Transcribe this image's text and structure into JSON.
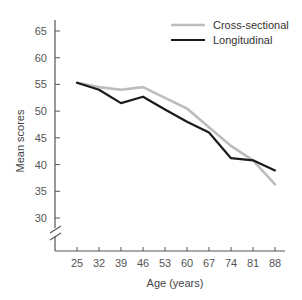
{
  "chart_data": {
    "type": "line",
    "title": "",
    "xlabel": "Age (years)",
    "ylabel": "Mean scores",
    "x": [
      25,
      32,
      39,
      46,
      53,
      60,
      67,
      74,
      81,
      88
    ],
    "categories": [
      "25",
      "32",
      "39",
      "46",
      "53",
      "60",
      "67",
      "74",
      "81",
      "88"
    ],
    "yticks": [
      30,
      35,
      40,
      45,
      50,
      55,
      60,
      65
    ],
    "ylim": [
      25,
      67
    ],
    "axis_break": true,
    "grid": false,
    "legend_position": "top-right",
    "series": [
      {
        "name": "Cross-sectional",
        "color": "#bdbdbd",
        "values": [
          55.3,
          54.5,
          54.0,
          54.5,
          52.5,
          50.5,
          47.0,
          43.5,
          40.8,
          36.3
        ]
      },
      {
        "name": "Longitudinal",
        "color": "#1a1a1a",
        "values": [
          55.3,
          54.0,
          51.5,
          52.7,
          50.3,
          48.0,
          46.0,
          41.2,
          40.8,
          38.9
        ]
      }
    ]
  },
  "axes": {
    "x_title": "Age (years)",
    "y_title": "Mean scores"
  },
  "legend": {
    "items": [
      {
        "label": "Cross-sectional",
        "color": "#bdbdbd"
      },
      {
        "label": "Longitudinal",
        "color": "#1a1a1a"
      }
    ]
  }
}
